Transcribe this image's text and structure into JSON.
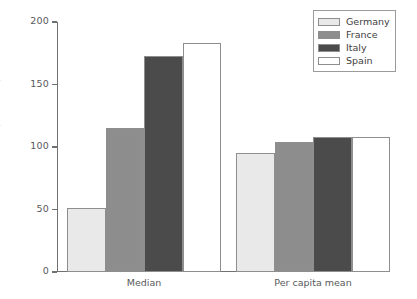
{
  "chart_data": {
    "type": "bar",
    "title": "",
    "xlabel": "",
    "ylabel": "('000 Euro)",
    "categories": [
      "Median",
      "Per capita mean"
    ],
    "series": [
      {
        "name": "Germany",
        "values": [
          51,
          95
        ],
        "color": "#e9e9e9"
      },
      {
        "name": "France",
        "values": [
          115,
          104
        ],
        "color": "#8d8d8d"
      },
      {
        "name": "Italy",
        "values": [
          173,
          108
        ],
        "color": "#4b4b4b"
      },
      {
        "name": "Spain",
        "values": [
          183,
          108
        ],
        "color": "#ffffff"
      }
    ],
    "ylim": [
      0,
      200
    ],
    "yticks": [
      0,
      50,
      100,
      150,
      200
    ],
    "ytick_labels": [
      "0",
      "50",
      "100",
      "150",
      "200"
    ],
    "grid": false,
    "legend_position": "top-right",
    "bar_border_color": "#8d8e90",
    "axis_color": "#6f7072",
    "text_color": "#58595b"
  },
  "legend": {
    "entries": [
      {
        "label": "Germany"
      },
      {
        "label": "France"
      },
      {
        "label": "Italy"
      },
      {
        "label": "Spain"
      }
    ]
  }
}
